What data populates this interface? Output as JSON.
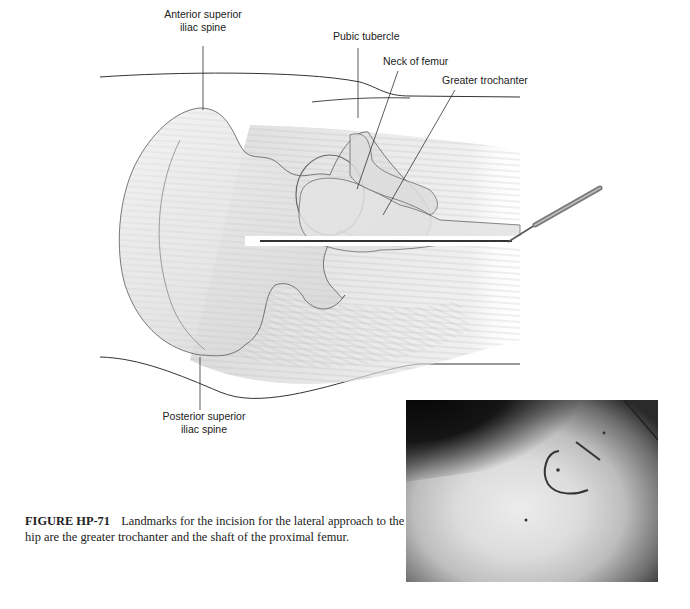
{
  "figure": {
    "labels": {
      "asis_line1": "Anterior superior",
      "asis_line2": "iliac spine",
      "pubic_tubercle": "Pubic tubercle",
      "neck_of_femur": "Neck of femur",
      "greater_trochanter": "Greater trochanter",
      "psis_line1": "Posterior superior",
      "psis_line2": "iliac spine"
    },
    "caption": {
      "figure_number": "FIGURE HP-71",
      "text": "Landmarks for the incision for the lateral approach to the hip are the greater trochanter and the shaft of the proximal femur."
    },
    "photo": {
      "description": "Photograph of skin marking over hip showing arc and line incision marks"
    }
  }
}
